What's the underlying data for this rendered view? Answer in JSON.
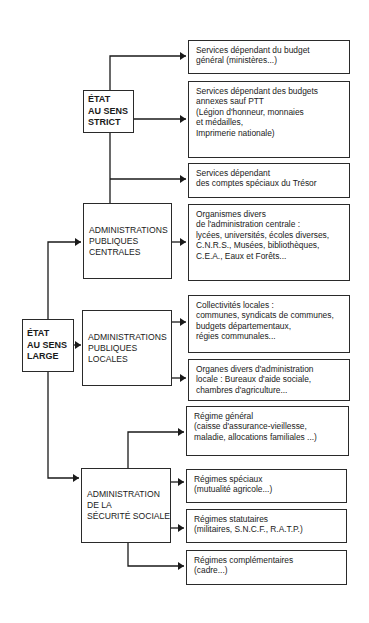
{
  "diagram": {
    "type": "org-tree",
    "colors": {
      "line": "#1a1a1a",
      "box_border": "#2a2a2a",
      "background": "#ffffff"
    },
    "root_strict": {
      "label_lines": [
        "ÉTAT",
        "AU SENS",
        "STRICT"
      ],
      "children": [
        {
          "id": "budget-general",
          "lines": [
            "Services dépendant du budget",
            "général (ministères...)"
          ]
        },
        {
          "id": "budgets-annexes",
          "lines": [
            "Services dépendant des budgets",
            "annexes sauf PTT",
            "(Légion d'honneur, monnaies",
            "et médailles,",
            "Imprimerie nationale)"
          ]
        },
        {
          "id": "comptes-speciaux",
          "lines": [
            "Services dépendant",
            "des comptes spéciaux du Trésor"
          ]
        }
      ]
    },
    "root_large": {
      "label_lines": [
        "ÉTAT",
        "AU SENS",
        "LARGE"
      ]
    },
    "admin_centrales": {
      "label_lines": [
        "ADMINISTRATIONS",
        "PUBLIQUES",
        "CENTRALES"
      ],
      "children": [
        {
          "id": "organismes-divers",
          "lines": [
            "Organismes divers",
            "de l'administration centrale :",
            "lycées, universités, écoles diverses,",
            "C.N.R.S., Musées, bibliothèques,",
            "C.E.A., Eaux et Forêts..."
          ]
        }
      ]
    },
    "admin_locales": {
      "label_lines": [
        "ADMINISTRATIONS",
        "PUBLIQUES",
        "LOCALES"
      ],
      "children": [
        {
          "id": "collectivites-locales",
          "lines": [
            "Collectivités locales :",
            "communes, syndicats de communes,",
            "budgets départementaux,",
            "régies communales..."
          ]
        },
        {
          "id": "organes-divers",
          "lines": [
            "Organes divers d'administration",
            "locale : Bureaux d'aide sociale,",
            "chambres d'agriculture..."
          ]
        }
      ]
    },
    "securite_sociale": {
      "label_lines": [
        "ADMINISTRATION",
        "DE LA",
        "SÉCURITÉ SOCIALE"
      ],
      "children": [
        {
          "id": "regime-general",
          "lines": [
            "Régime général",
            "(caisse d'assurance-vieillesse,",
            "maladie, allocations familiales ...)"
          ]
        },
        {
          "id": "regimes-speciaux",
          "lines": [
            "Régimes spéciaux",
            "(mutualité agricole...)"
          ]
        },
        {
          "id": "regimes-statutaires",
          "lines": [
            "Régimes statutaires",
            "(militaires, S.N.C.F., R.A.T.P.)"
          ]
        },
        {
          "id": "regimes-complementaires",
          "lines": [
            "Régimes complémentaires",
            "(cadre...)"
          ]
        }
      ]
    }
  }
}
